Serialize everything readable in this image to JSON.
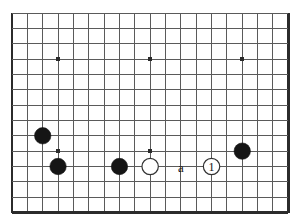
{
  "diagram": {
    "kind": "go-board-diagram",
    "board": {
      "columns": 18,
      "rows": 13,
      "origin_x": 12,
      "origin_y": 13,
      "cell": 15.35,
      "edges": {
        "left": true,
        "right": true,
        "bottom": true,
        "top": false
      },
      "line_color": "#5a5a5a",
      "edge_color": "#2b2b2b",
      "background_color": "#ffffff",
      "line_width": 1,
      "edge_width": 2.4
    },
    "star_points": [
      {
        "name": "star-point-upper-left",
        "col": 3,
        "row": 3
      },
      {
        "name": "star-point-upper-mid",
        "col": 9,
        "row": 3
      },
      {
        "name": "star-point-upper-right",
        "col": 15,
        "row": 3
      },
      {
        "name": "star-point-lower-left",
        "col": 3,
        "row": 9
      },
      {
        "name": "star-point-lower-mid",
        "col": 9,
        "row": 9
      }
    ],
    "star_radius": 2,
    "stones": [
      {
        "name": "black-stone-1",
        "color": "black",
        "col": 2,
        "row": 8,
        "label": ""
      },
      {
        "name": "black-stone-2",
        "color": "black",
        "col": 3,
        "row": 10,
        "label": ""
      },
      {
        "name": "black-stone-3",
        "color": "black",
        "col": 7,
        "row": 10,
        "label": ""
      },
      {
        "name": "white-stone-1",
        "color": "white",
        "col": 9,
        "row": 10,
        "label": ""
      },
      {
        "name": "white-stone-move-1",
        "color": "white",
        "col": 13,
        "row": 10,
        "label": "1"
      },
      {
        "name": "black-stone-4",
        "color": "black",
        "col": 15,
        "row": 9,
        "label": ""
      }
    ],
    "stone_radius": 8.2,
    "black_fill": "#151515",
    "white_fill": "#ffffff",
    "white_outline": "#333333",
    "annotations": [
      {
        "name": "point-label-a",
        "text": "a",
        "col": 11,
        "row": 10
      }
    ],
    "legend_note": ""
  }
}
